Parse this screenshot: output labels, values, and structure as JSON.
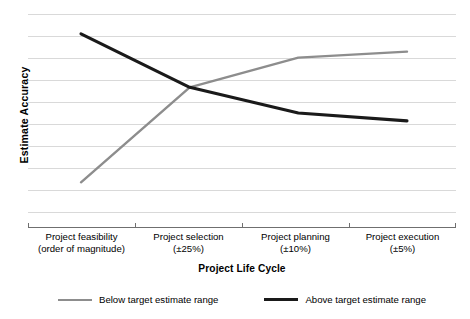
{
  "chart_data": {
    "type": "line",
    "title": "",
    "xlabel": "Project Life Cycle",
    "ylabel": "Estimate Accuracy",
    "grid": true,
    "gridlines": 10,
    "legend_position": "bottom",
    "categories": [
      "Project feasibility (order of magnitude)",
      "Project selection (±25%)",
      "Project planning (±10%)",
      "Project execution (±5%)"
    ],
    "tick_labels": [
      {
        "line1": "Project feasibility",
        "line2": "(order of magnitude)"
      },
      {
        "line1": "Project selection",
        "line2": "(±25%)"
      },
      {
        "line1": "Project planning",
        "line2": "(±10%)"
      },
      {
        "line1": "Project execution",
        "line2": "(±5%)"
      }
    ],
    "ylim": [
      0,
      100
    ],
    "y_axis_ticks_shown": false,
    "series": [
      {
        "name": "Below target estimate range",
        "color": "#8d8d8d",
        "values": [
          15,
          63,
          78,
          81
        ]
      },
      {
        "name": "Above target estimate range",
        "color": "#1a1a1a",
        "values": [
          90,
          63,
          50,
          46
        ]
      }
    ]
  },
  "legend": {
    "items": [
      {
        "label": "Below target estimate range",
        "color": "#8d8d8d"
      },
      {
        "label": "Above target estimate range",
        "color": "#1a1a1a"
      }
    ]
  },
  "axes": {
    "x_title": "Project Life Cycle",
    "y_title": "Estimate Accuracy"
  },
  "colors": {
    "grid": "#d9d9d9",
    "axis": "#7a7a7a",
    "below_series": "#8d8d8d",
    "above_series": "#1a1a1a",
    "text": "#000000",
    "background": "#ffffff"
  }
}
